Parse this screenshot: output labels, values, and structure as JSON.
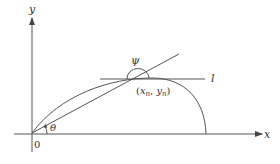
{
  "diagram": {
    "type": "geometry",
    "axes": {
      "x_label": "x",
      "y_label": "y",
      "origin_label": "0"
    },
    "labels": {
      "angle_theta": "θ",
      "angle_psi": "ψ",
      "line_l": "l",
      "point_open": "(",
      "point_x": "x",
      "point_x_sub": "n",
      "point_sep": ", ",
      "point_y": "y",
      "point_y_sub": "n",
      "point_close": ")"
    },
    "colors": {
      "line": "#555555",
      "text": "#333333",
      "background": "#ffffff"
    }
  }
}
